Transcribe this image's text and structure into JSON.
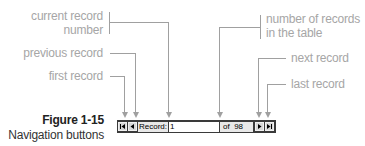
{
  "annotations": {
    "current_record_number": [
      "current record",
      "number"
    ],
    "previous_record": "previous record",
    "first_record": "first record",
    "number_of_records": [
      "number of records",
      "in the table"
    ],
    "next_record": "next record",
    "last_record": "last record"
  },
  "caption": {
    "title": "Figure 1-15",
    "subtitle": "Navigation buttons"
  },
  "navbar": {
    "record_label": "Record:",
    "current_record": "1",
    "of_label": "of",
    "total_records": "98",
    "icons": {
      "first": "first-record-icon",
      "previous": "previous-record-icon",
      "next": "next-record-icon",
      "last": "last-record-icon"
    }
  },
  "colors": {
    "callout": "#a6a6a6",
    "navbar_bg": "#3a3a3a",
    "button_face": "#d8d8d8"
  }
}
